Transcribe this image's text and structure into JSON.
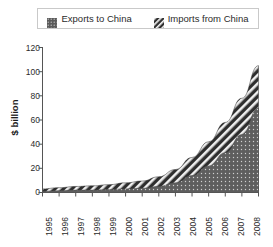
{
  "legend": {
    "entries": [
      {
        "label": "Exports to China",
        "swatch": "dotted-swatch",
        "color": "#595959"
      },
      {
        "label": "Imports from China",
        "swatch": "hatched-swatch",
        "color": "#333333"
      }
    ]
  },
  "axes": {
    "ylabel": "$ billion",
    "yticks": [
      "0",
      "20",
      "40",
      "60",
      "80",
      "100",
      "120"
    ],
    "xticks": [
      "1995",
      "1996",
      "1997",
      "1998",
      "1999",
      "2000",
      "2001",
      "2002",
      "2003",
      "2004",
      "2005",
      "2006",
      "2007",
      "2008"
    ]
  },
  "chart_data": {
    "type": "area",
    "title": "",
    "subtitle": "",
    "xlabel": "",
    "ylabel": "$ billion",
    "ylim": [
      0,
      120
    ],
    "grid": false,
    "stacked": true,
    "legend_position": "top",
    "categories": [
      "1995",
      "1996",
      "1997",
      "1998",
      "1999",
      "2000",
      "2001",
      "2002",
      "2003",
      "2004",
      "2005",
      "2006",
      "2007",
      "2008"
    ],
    "series": [
      {
        "name": "Exports to China",
        "values": [
          1,
          1.5,
          2,
          2,
          2.5,
          3,
          3.5,
          5,
          8,
          14,
          22,
          33,
          48,
          70
        ]
      },
      {
        "name": "Imports from China",
        "values": [
          2,
          2.5,
          3,
          3.5,
          4,
          5,
          6,
          8,
          11,
          15,
          20,
          25,
          30,
          35
        ]
      }
    ],
    "totals": [
      3,
      4,
      5,
      5.5,
      6.5,
      8,
      9.5,
      13,
      19,
      29,
      42,
      58,
      78,
      105
    ],
    "annotations": []
  }
}
